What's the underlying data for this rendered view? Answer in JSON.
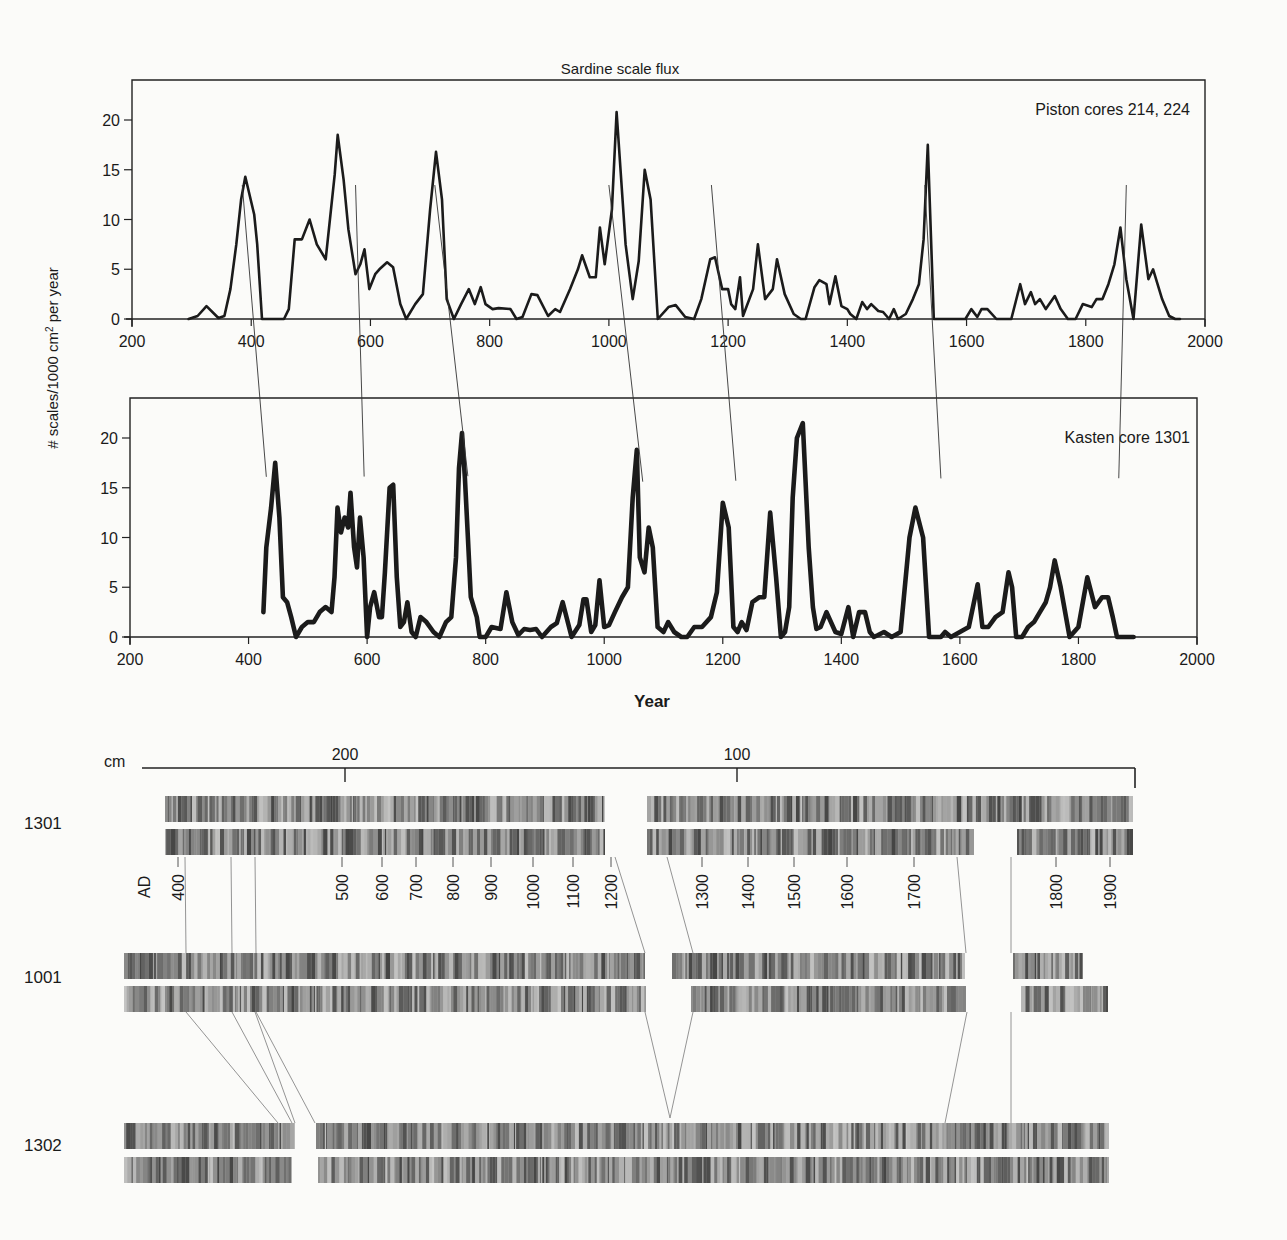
{
  "figure": {
    "title": "Sardine scale flux",
    "ylabel": "# scales/1000 cm² per year",
    "xlabel": "Year"
  },
  "chart_data": [
    {
      "type": "line",
      "title": "Sardine scale flux",
      "panel_label": "Piston cores 214, 224",
      "xlabel": "",
      "ylabel": "# scales/1000 cm² per year",
      "xlim": [
        200,
        2000
      ],
      "ylim": [
        0,
        23
      ],
      "xticks": [
        200,
        400,
        600,
        800,
        1000,
        1200,
        1400,
        1600,
        1800,
        2000
      ],
      "yticks": [
        0,
        5,
        10,
        15,
        20
      ],
      "grid": false,
      "series": [
        {
          "name": "Piston cores 214, 224",
          "x": [
            295,
            310,
            325,
            345,
            355,
            365,
            375,
            383,
            390,
            405,
            410,
            418,
            440,
            455,
            463,
            473,
            485,
            498,
            510,
            525,
            540,
            545,
            555,
            563,
            575,
            583,
            590,
            598,
            608,
            615,
            628,
            638,
            650,
            660,
            675,
            688,
            700,
            710,
            720,
            728,
            740,
            752,
            765,
            775,
            785,
            793,
            805,
            815,
            835,
            845,
            855,
            870,
            880,
            898,
            910,
            918,
            935,
            948,
            955,
            968,
            978,
            985,
            993,
            1005,
            1013,
            1028,
            1040,
            1050,
            1060,
            1070,
            1082,
            1100,
            1112,
            1128,
            1143,
            1155,
            1170,
            1178,
            1190,
            1200,
            1205,
            1212,
            1220,
            1225,
            1242,
            1250,
            1262,
            1275,
            1282,
            1295,
            1310,
            1322,
            1330,
            1345,
            1353,
            1365,
            1370,
            1380,
            1390,
            1400,
            1405,
            1415,
            1425,
            1433,
            1440,
            1452,
            1460,
            1470,
            1478,
            1485,
            1498,
            1510,
            1520,
            1528,
            1535,
            1545,
            1560,
            1580,
            1590,
            1598,
            1608,
            1618,
            1625,
            1635,
            1650,
            1665,
            1675,
            1690,
            1698,
            1708,
            1715,
            1723,
            1733,
            1748,
            1758,
            1770,
            1783,
            1795,
            1810,
            1818,
            1828,
            1838,
            1848,
            1858,
            1868,
            1880,
            1893,
            1905,
            1913,
            1928,
            1940,
            1950,
            1958,
            1970
          ],
          "y": [
            0,
            0.3,
            1.3,
            0.1,
            0.3,
            3,
            7.5,
            12,
            14.3,
            10.5,
            7.5,
            0,
            0,
            0,
            1,
            8,
            8,
            10,
            7.5,
            6,
            14.5,
            18.5,
            14,
            9,
            4.5,
            5.5,
            7,
            3,
            4.5,
            5,
            5.7,
            5.2,
            1.5,
            0,
            1.5,
            2.5,
            11,
            16.8,
            12,
            2,
            0,
            1.5,
            3,
            1.5,
            3.2,
            1.5,
            1,
            1.1,
            1,
            0,
            0.2,
            2.5,
            2.4,
            0.3,
            1,
            0.7,
            3,
            5,
            6.4,
            4.2,
            4.2,
            9.2,
            5.5,
            11,
            20.8,
            7.5,
            2,
            5.8,
            15,
            12,
            0,
            1.2,
            1.4,
            0.2,
            0,
            2,
            6,
            6.2,
            3,
            3,
            1.5,
            1,
            4.2,
            0.3,
            3,
            7.5,
            2,
            3,
            6,
            2.5,
            0.5,
            0,
            0,
            3.2,
            3.9,
            3.5,
            1.5,
            4.3,
            1.3,
            1,
            0.5,
            0,
            1.7,
            1,
            1.5,
            0.8,
            0.7,
            0,
            1,
            0,
            0.5,
            2,
            3.5,
            8,
            17.5,
            0,
            0,
            0,
            0,
            0,
            1,
            0.2,
            1,
            1,
            0,
            0,
            0,
            3.5,
            1.5,
            2.7,
            1.5,
            2,
            1,
            2.3,
            1,
            0,
            0,
            1.5,
            1.2,
            2,
            2,
            3.5,
            5.5,
            9.2,
            4,
            0,
            9.5,
            4,
            5,
            2,
            0.3,
            0,
            0
          ]
        }
      ]
    },
    {
      "type": "line",
      "panel_label": "Kasten core 1301",
      "xlabel": "Year",
      "ylabel": "# scales/1000 cm² per year",
      "xlim": [
        200,
        2000
      ],
      "ylim": [
        0,
        23
      ],
      "xticks": [
        200,
        400,
        600,
        800,
        1000,
        1200,
        1400,
        1600,
        1800,
        2000
      ],
      "yticks": [
        0,
        5,
        10,
        15,
        20
      ],
      "grid": false,
      "series": [
        {
          "name": "Kasten core 1301",
          "x": [
            425,
            430,
            438,
            445,
            452,
            458,
            465,
            472,
            480,
            490,
            500,
            510,
            520,
            530,
            540,
            545,
            550,
            556,
            562,
            568,
            572,
            578,
            583,
            588,
            594,
            600,
            605,
            612,
            620,
            625,
            630,
            638,
            644,
            650,
            656,
            662,
            668,
            675,
            682,
            690,
            700,
            712,
            722,
            733,
            742,
            750,
            755,
            760,
            765,
            770,
            775,
            780,
            785,
            790,
            800,
            810,
            825,
            835,
            845,
            855,
            865,
            875,
            885,
            895,
            910,
            920,
            930,
            945,
            958,
            965,
            970,
            978,
            985,
            992,
            1000,
            1008,
            1018,
            1030,
            1040,
            1048,
            1055,
            1060,
            1068,
            1075,
            1082,
            1090,
            1100,
            1108,
            1118,
            1130,
            1140,
            1152,
            1165,
            1180,
            1190,
            1200,
            1210,
            1218,
            1225,
            1232,
            1240,
            1250,
            1262,
            1270,
            1280,
            1290,
            1298,
            1305,
            1312,
            1318,
            1325,
            1335,
            1345,
            1352,
            1358,
            1365,
            1375,
            1390,
            1400,
            1412,
            1420,
            1430,
            1440,
            1448,
            1455,
            1462,
            1472,
            1485,
            1500,
            1515,
            1525,
            1538,
            1548,
            1556,
            1562,
            1568,
            1575,
            1585,
            1600,
            1615,
            1630,
            1638,
            1648,
            1660,
            1672,
            1682,
            1688,
            1695,
            1705,
            1715,
            1725,
            1735,
            1745,
            1752,
            1760,
            1770,
            1785,
            1800,
            1815,
            1828,
            1840,
            1850,
            1858,
            1865,
            1875,
            1885,
            1893,
            1900,
            1908,
            1915,
            1922,
            1930,
            1940,
            1950,
            1965
          ],
          "y": [
            2.5,
            9,
            13,
            17.5,
            12,
            4,
            3.5,
            2,
            0,
            1,
            1.5,
            1.5,
            2.5,
            3,
            2.5,
            6,
            13,
            10.5,
            12,
            11,
            14.5,
            9,
            7,
            12,
            8,
            0,
            3,
            4.5,
            2,
            2,
            6.5,
            15,
            15.3,
            6,
            1,
            1.5,
            3.5,
            0.5,
            0,
            2,
            1.5,
            0.5,
            0,
            1.5,
            2,
            8,
            17,
            20.5,
            16,
            10,
            4,
            3,
            2,
            0,
            0,
            1,
            0.8,
            4.5,
            1.5,
            0.2,
            0.8,
            0.7,
            0.8,
            0,
            1,
            1.4,
            3.5,
            0,
            1.2,
            3.8,
            3.8,
            0.5,
            1.2,
            5.7,
            1,
            1.2,
            2.5,
            4,
            5,
            14,
            18.8,
            8,
            6.5,
            11,
            9,
            1,
            0.5,
            1.5,
            0.5,
            0,
            0,
            1,
            1,
            2,
            4.5,
            13.5,
            11,
            1,
            0.5,
            1.5,
            0.7,
            3.5,
            4,
            4,
            12.5,
            6,
            0,
            0.5,
            3,
            14,
            20,
            21.5,
            9,
            3,
            0.8,
            1,
            2.5,
            0.5,
            0.3,
            3,
            0,
            2.5,
            2.5,
            0.5,
            0,
            0.2,
            0.5,
            0,
            0.5,
            10,
            13,
            10,
            0,
            0,
            0,
            0,
            0.5,
            0,
            0.5,
            1,
            5.3,
            1,
            1,
            2,
            2.5,
            6.5,
            5,
            0,
            0,
            1,
            1.5,
            2.5,
            3.5,
            5,
            7.7,
            5,
            0,
            1,
            6,
            3,
            4,
            4,
            2,
            0,
            0,
            0,
            0
          ]
        }
      ]
    }
  ],
  "correlation_lines": [
    {
      "from_year": 385,
      "to_year": 430
    },
    {
      "from_year": 575,
      "to_year": 595
    },
    {
      "from_year": 708,
      "to_year": 770
    },
    {
      "from_year": 1000,
      "to_year": 1065
    },
    {
      "from_year": 1172,
      "to_year": 1222
    },
    {
      "from_year": 1530,
      "to_year": 1568
    },
    {
      "from_year": 1868,
      "to_year": 1868
    }
  ],
  "core_images": {
    "depth_scale": {
      "unit": "cm",
      "ticks": [
        {
          "label": "200",
          "x": 345
        },
        {
          "label": "100",
          "x": 737
        }
      ]
    },
    "cores": [
      {
        "id": "1301",
        "label": "1301"
      },
      {
        "id": "1001",
        "label": "1001"
      },
      {
        "id": "1302",
        "label": "1302"
      }
    ],
    "ad_label": "AD",
    "ad_ticks": [
      {
        "label": "400",
        "x": 178
      },
      {
        "label": "500",
        "x": 342
      },
      {
        "label": "600",
        "x": 382
      },
      {
        "label": "700",
        "x": 416
      },
      {
        "label": "800",
        "x": 453
      },
      {
        "label": "900",
        "x": 491
      },
      {
        "label": "1000",
        "x": 533
      },
      {
        "label": "1100",
        "x": 573
      },
      {
        "label": "1200",
        "x": 611
      },
      {
        "label": "1300",
        "x": 702
      },
      {
        "label": "1400",
        "x": 748
      },
      {
        "label": "1500",
        "x": 794
      },
      {
        "label": "1600",
        "x": 847
      },
      {
        "label": "1700",
        "x": 914
      },
      {
        "label": "1800",
        "x": 1056
      },
      {
        "label": "1900",
        "x": 1110
      }
    ]
  }
}
